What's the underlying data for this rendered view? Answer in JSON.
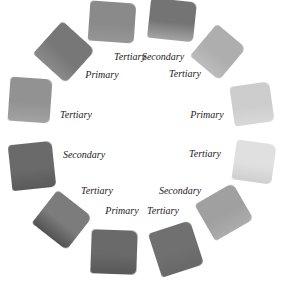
{
  "swatches": [
    {
      "id": "s1",
      "label": "Tertiary",
      "cx": 112,
      "cy": 22,
      "w": 46,
      "h": 40,
      "rot": 4,
      "top": "#8a8a8a",
      "bottom": "#969696",
      "lx": 130,
      "ly": 57
    },
    {
      "id": "s2",
      "label": "Secondary",
      "cx": 172,
      "cy": 20,
      "w": 46,
      "h": 40,
      "rot": 6,
      "top": "#747474",
      "bottom": "#a4a4a4",
      "lx": 163,
      "ly": 57
    },
    {
      "id": "s3",
      "label": "Tertiary",
      "cx": 218,
      "cy": 52,
      "w": 38,
      "h": 42,
      "rot": 40,
      "top": "#aeaeae",
      "bottom": "#bcbcbc",
      "lx": 185,
      "ly": 74
    },
    {
      "id": "s4",
      "label": "Primary",
      "cx": 252,
      "cy": 104,
      "w": 40,
      "h": 40,
      "rot": -8,
      "top": "#cdcdcd",
      "bottom": "#d8d8d8",
      "lx": 207,
      "ly": 115
    },
    {
      "id": "s5",
      "label": "Tertiary",
      "cx": 254,
      "cy": 162,
      "w": 40,
      "h": 40,
      "rot": 8,
      "top": "#e0e0e0",
      "bottom": "#cfcfcf",
      "lx": 205,
      "ly": 154
    },
    {
      "id": "s6",
      "label": "Secondary",
      "cx": 224,
      "cy": 212,
      "w": 44,
      "h": 42,
      "rot": -30,
      "top": "#a0a0a0",
      "bottom": "#acacac",
      "lx": 180,
      "ly": 191
    },
    {
      "id": "s7",
      "label": "Tertiary",
      "cx": 176,
      "cy": 249,
      "w": 44,
      "h": 46,
      "rot": -18,
      "top": "#707070",
      "bottom": "#686868",
      "lx": 163,
      "ly": 211
    },
    {
      "id": "s8",
      "label": "Primary",
      "cx": 114,
      "cy": 252,
      "w": 46,
      "h": 44,
      "rot": 2,
      "top": "#6a6a6a",
      "bottom": "#585858",
      "lx": 122,
      "ly": 211
    },
    {
      "id": "s9",
      "label": "Tertiary",
      "cx": 62,
      "cy": 220,
      "w": 44,
      "h": 42,
      "rot": 38,
      "top": "#7c7c7c",
      "bottom": "#525252",
      "lx": 97,
      "ly": 191
    },
    {
      "id": "s10",
      "label": "Secondary",
      "cx": 32,
      "cy": 166,
      "w": 44,
      "h": 46,
      "rot": -6,
      "top": "#6a6a6a",
      "bottom": "#5a5a5a",
      "lx": 84,
      "ly": 155
    },
    {
      "id": "s11",
      "label": "Tertiary",
      "cx": 30,
      "cy": 100,
      "w": 42,
      "h": 44,
      "rot": 4,
      "top": "#929292",
      "bottom": "#a2a2a2",
      "lx": 76,
      "ly": 115
    },
    {
      "id": "s12",
      "label": "Primary",
      "cx": 64,
      "cy": 52,
      "w": 44,
      "h": 44,
      "rot": 42,
      "top": "#777777",
      "bottom": "#8a8a8a",
      "lx": 102,
      "ly": 75
    }
  ]
}
